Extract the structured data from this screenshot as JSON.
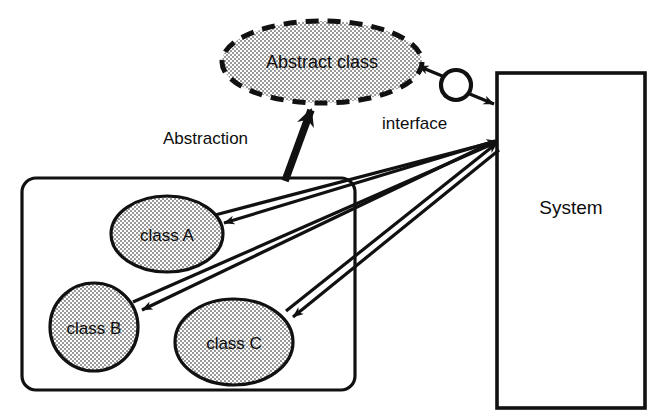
{
  "diagram": {
    "background_color": "#ffffff",
    "stroke_color": "#111111",
    "fill_pattern_color": "#8c8c8c",
    "nodes": {
      "abstract_class": {
        "label": "Abstract class",
        "shape": "ellipse-dashed",
        "cx": 322,
        "cy": 62,
        "rx": 100,
        "ry": 41,
        "filled": true
      },
      "class_a": {
        "label": "class A",
        "shape": "ellipse",
        "cx": 167,
        "cy": 234,
        "rx": 56,
        "ry": 38,
        "filled": true
      },
      "class_b": {
        "label": "class B",
        "shape": "ellipse",
        "cx": 94,
        "cy": 327,
        "rx": 44,
        "ry": 44,
        "filled": true
      },
      "class_c": {
        "label": "class C",
        "shape": "ellipse",
        "cx": 234,
        "cy": 342,
        "rx": 59,
        "ry": 43,
        "filled": true
      },
      "system": {
        "label": "System",
        "shape": "rectangle",
        "x": 497,
        "y": 73,
        "width": 148,
        "height": 335,
        "label_x": 571,
        "label_y": 214,
        "filled": false
      },
      "class_group": {
        "label": "",
        "shape": "rounded-rectangle",
        "x": 22,
        "y": 178,
        "width": 333,
        "height": 212,
        "radius": 14,
        "filled": false
      }
    },
    "edge_labels": [
      {
        "name": "abstraction",
        "text": "Abstraction",
        "x": 163,
        "y": 144
      },
      {
        "name": "interface",
        "text": "interface",
        "x": 382,
        "y": 129
      }
    ],
    "connectors": [
      {
        "name": "abstraction-arrow",
        "from": "class-group",
        "to": "abstract-class",
        "style": "thick-solid-arrow",
        "arrow_at": "abstract-class"
      },
      {
        "name": "interface-link",
        "from": "abstract-class",
        "to": "system",
        "style": "double-headed-arrow-through-circle",
        "symbol": "interface-lollipop"
      },
      {
        "name": "system-to-class-a",
        "from": "system",
        "to": "class-a",
        "style": "solid-arrow",
        "arrow_at": "class-a"
      },
      {
        "name": "system-to-class-b",
        "from": "system",
        "to": "class-b",
        "style": "solid-arrow",
        "arrow_at": "class-b"
      },
      {
        "name": "system-to-class-c",
        "from": "system",
        "to": "class-c",
        "style": "solid-arrow",
        "arrow_at": "class-c"
      },
      {
        "name": "class-a-to-system",
        "from": "class-a",
        "to": "system",
        "style": "solid-arrow",
        "arrow_at": "system"
      },
      {
        "name": "class-b-to-system",
        "from": "class-b",
        "to": "system",
        "style": "solid-arrow",
        "arrow_at": "system"
      },
      {
        "name": "class-c-to-system",
        "from": "class-c",
        "to": "system",
        "style": "solid-arrow",
        "arrow_at": "system"
      }
    ],
    "interface_symbol": {
      "name": "interface-lollipop",
      "cx": 456,
      "cy": 85,
      "r": 15
    }
  }
}
